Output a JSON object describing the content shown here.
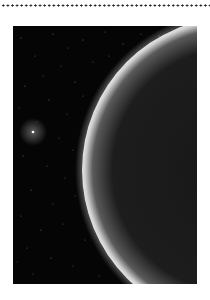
{
  "page": {
    "divider": "dotted-rule",
    "figure": {
      "subject": "Planet limb against star field",
      "description": "Dark space with scattered faint stars, a bright star at left, and the illuminated crescent edge of a large gas planet curving across the right side",
      "colors": {
        "space": "#050505",
        "planet_body": "#1c1c1c",
        "limb_glow": "#d8d8d8",
        "star": "#ffffff",
        "page_background": "#ffffff",
        "dots": "#222222"
      },
      "bright_star": {
        "x": 20,
        "y": 106
      }
    }
  }
}
